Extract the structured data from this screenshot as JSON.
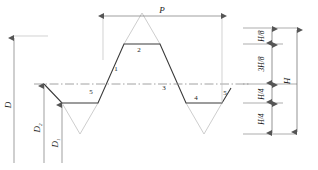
{
  "diagram": {
    "colors": {
      "profile_line": "#333333",
      "construction_line": "#b0b0b0",
      "dimension_line": "#888888",
      "centerline": "#999999",
      "text": "#1a1a1a",
      "background": "#ffffff"
    },
    "dimensions": {
      "pitch": {
        "label": "P",
        "orientation": "horizontal",
        "position": "top"
      },
      "major_diameter": {
        "label": "D",
        "orientation": "vertical",
        "position": "left"
      },
      "pitch_diameter": {
        "label": "D",
        "subscript": "2",
        "orientation": "vertical",
        "position": "left"
      },
      "minor_diameter": {
        "label": "D",
        "subscript": "1",
        "orientation": "vertical",
        "position": "left"
      },
      "total_height": {
        "label": "H",
        "orientation": "vertical",
        "position": "far-right"
      }
    },
    "height_divisions": [
      {
        "label": "H/8",
        "order": 1
      },
      {
        "label": "3H/8",
        "order": 2
      },
      {
        "label": "H/4",
        "order": 3
      },
      {
        "label": "H/4",
        "order": 4
      }
    ],
    "profile_markers": [
      {
        "label": "1"
      },
      {
        "label": "2"
      },
      {
        "label": "3"
      },
      {
        "label": "4"
      },
      {
        "label": "5"
      },
      {
        "label": "5"
      }
    ]
  }
}
